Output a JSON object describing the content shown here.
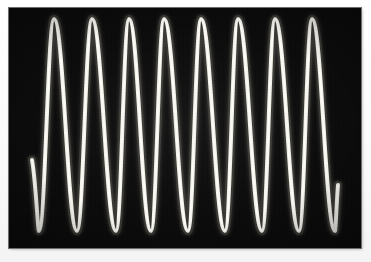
{
  "image": {
    "title": "Oscilloscope sine wave trace",
    "width": 371,
    "height": 262,
    "background_color": "#fdfdfd"
  },
  "display": {
    "label": "scope-screen",
    "x": 9,
    "y": 8,
    "width": 352,
    "height": 240,
    "screen_color": "#0a0a0a",
    "border_color": "#6e6e6e",
    "trace_color": "#f5f2e8",
    "glow_color": "#ffffff",
    "trace_width_px": 4
  },
  "chart_data": {
    "type": "line",
    "title": "Oscilloscope sine wave trace",
    "subtitle": "",
    "xlabel": "",
    "ylabel": "",
    "grid": false,
    "legend": "none",
    "xlim": [
      9,
      361
    ],
    "ylim": [
      8,
      248
    ],
    "waveform": "sine",
    "cycles_visible": 8,
    "period_px": 37.2,
    "peak_y_px": 19,
    "trough_y_px": 231,
    "amplitude_px": 106,
    "baseline_y_px": 125,
    "trace_start": {
      "x": 32,
      "y": 160
    },
    "trace_end": {
      "x": 338,
      "y": 185
    },
    "peaks_x_px": [
      54,
      92,
      129,
      164,
      201,
      238,
      275,
      312
    ],
    "troughs_x_px": [
      39,
      77,
      116,
      151,
      188,
      225,
      262,
      299,
      335
    ],
    "series": [
      {
        "name": "channel-1",
        "color": "#f5f2e8",
        "x": [
          32,
          39,
          54,
          77,
          92,
          116,
          129,
          151,
          164,
          188,
          201,
          225,
          238,
          262,
          275,
          299,
          312,
          335,
          338
        ],
        "y": [
          160,
          231,
          19,
          231,
          19,
          231,
          19,
          231,
          19,
          231,
          19,
          231,
          19,
          231,
          19,
          231,
          19,
          231,
          185
        ]
      }
    ]
  }
}
